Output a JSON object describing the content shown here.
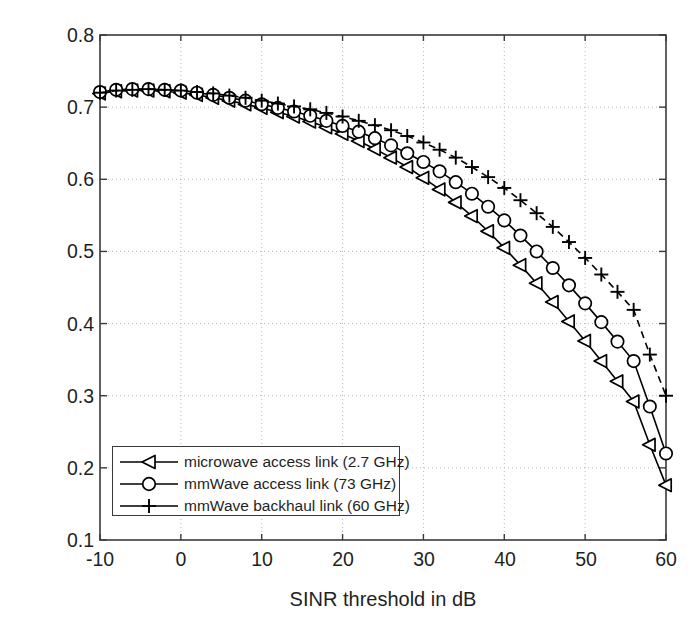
{
  "chart_data": {
    "type": "line",
    "title": "",
    "xlabel": "SINR threshold in dB",
    "ylabel": "SINR coverage probability",
    "xlim": [
      -10,
      60
    ],
    "ylim": [
      0.1,
      0.8
    ],
    "xticks": [
      "-10",
      "0",
      "10",
      "20",
      "30",
      "40",
      "50",
      "60"
    ],
    "xtick_values": [
      -10,
      0,
      10,
      20,
      30,
      40,
      50,
      60
    ],
    "yticks": [
      "0.1",
      "0.2",
      "0.3",
      "0.4",
      "0.5",
      "0.6",
      "0.7",
      "0.8"
    ],
    "ytick_values": [
      0.1,
      0.2,
      0.3,
      0.4,
      0.5,
      0.6,
      0.7,
      0.8
    ],
    "grid": true,
    "grid_style": "dotted",
    "legend_position": "lower-left",
    "x": [
      -10,
      -8,
      -6,
      -4,
      -2,
      0,
      2,
      4,
      6,
      8,
      10,
      12,
      14,
      16,
      18,
      20,
      22,
      24,
      26,
      28,
      30,
      32,
      34,
      36,
      38,
      40,
      42,
      44,
      46,
      48,
      50,
      52,
      54,
      56,
      58,
      60
    ],
    "series": [
      {
        "name": "microwave access link (2.7 GHz)",
        "marker": "triangle-left",
        "linestyle": "solid",
        "color": "#000000",
        "values": [
          0.719,
          0.722,
          0.723,
          0.723,
          0.722,
          0.72,
          0.717,
          0.713,
          0.709,
          0.704,
          0.699,
          0.693,
          0.687,
          0.68,
          0.672,
          0.663,
          0.653,
          0.642,
          0.63,
          0.617,
          0.602,
          0.586,
          0.568,
          0.549,
          0.528,
          0.505,
          0.481,
          0.456,
          0.43,
          0.403,
          0.376,
          0.348,
          0.32,
          0.292,
          0.232,
          0.176
        ]
      },
      {
        "name": "mmWave access link (73 GHz)",
        "marker": "circle",
        "linestyle": "solid",
        "color": "#000000",
        "values": [
          0.721,
          0.724,
          0.725,
          0.725,
          0.724,
          0.723,
          0.72,
          0.717,
          0.713,
          0.709,
          0.704,
          0.699,
          0.694,
          0.688,
          0.681,
          0.674,
          0.666,
          0.657,
          0.647,
          0.636,
          0.624,
          0.611,
          0.596,
          0.58,
          0.562,
          0.543,
          0.522,
          0.5,
          0.477,
          0.453,
          0.428,
          0.402,
          0.375,
          0.348,
          0.285,
          0.22
        ]
      },
      {
        "name": "mmWave backhaul link (60 GHz)",
        "marker": "plus",
        "linestyle": "dashed",
        "color": "#000000",
        "values": [
          0.72,
          0.723,
          0.724,
          0.725,
          0.724,
          0.723,
          0.721,
          0.719,
          0.716,
          0.713,
          0.709,
          0.705,
          0.701,
          0.697,
          0.692,
          0.687,
          0.681,
          0.675,
          0.668,
          0.66,
          0.651,
          0.641,
          0.63,
          0.617,
          0.603,
          0.588,
          0.571,
          0.553,
          0.534,
          0.513,
          0.491,
          0.468,
          0.444,
          0.419,
          0.357,
          0.3
        ]
      }
    ]
  },
  "legend": {
    "entries": [
      {
        "label": "microwave access link (2.7 GHz)",
        "marker": "triangle-left",
        "linestyle": "solid"
      },
      {
        "label": "mmWave access link (73 GHz)",
        "marker": "circle",
        "linestyle": "solid"
      },
      {
        "label": "mmWave backhaul link (60 GHz)",
        "marker": "plus",
        "linestyle": "dashed"
      }
    ]
  },
  "colors": {
    "axis": "#3a3a3a",
    "grid": "#b8b8b8",
    "line": "#000000",
    "text": "#1f1f1f",
    "background": "#ffffff"
  }
}
